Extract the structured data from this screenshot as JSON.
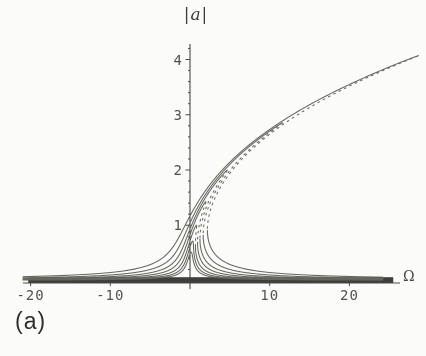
{
  "figure": {
    "title": "|a|",
    "x_axis_label": "Ω",
    "panel_label": "(a)",
    "background": "#fbfbf9"
  },
  "colors": {
    "curve": "#66665f",
    "unstable_dash": "#6b6b64",
    "axis": "#4a4a46",
    "zero_band": "#3e3e3b",
    "tick_text": "#53534e",
    "label_text": "#2e2e2b"
  },
  "chart_data": {
    "type": "line",
    "title": "|a|",
    "xlabel": "Ω",
    "ylabel": "|a|",
    "xlim": [
      -21,
      28.7
    ],
    "ylim": [
      0,
      4.3
    ],
    "x_ticks": [
      -20,
      -10,
      10,
      20
    ],
    "y_ticks": [
      1,
      2,
      3,
      4
    ],
    "y_minor_tick_step": 0.2,
    "grid": false,
    "legend": false,
    "model": {
      "equation": "a^2 * ((Ω - B(a))^2 + mu^2) = F^2, backbone B(a) = c * a^p",
      "backbone_coeff_c": 0.8,
      "backbone_power_p": 2.55,
      "damping_mu": 0.35,
      "forcing_F": [
        0.18,
        0.25,
        0.35,
        0.5,
        0.7,
        1.0,
        1.45
      ]
    },
    "series": [
      {
        "name": "F = 0.18",
        "forcing_F": 0.18,
        "peak_a": 0.51,
        "peak_omega": 0.14,
        "has_unstable_branch": false
      },
      {
        "name": "F = 0.25",
        "forcing_F": 0.25,
        "peak_a": 0.71,
        "peak_omega": 0.33,
        "has_unstable_branch": false
      },
      {
        "name": "F = 0.35",
        "forcing_F": 0.35,
        "peak_a": 1.0,
        "peak_omega": 0.8,
        "has_unstable_branch": true
      },
      {
        "name": "F = 0.50",
        "forcing_F": 0.5,
        "peak_a": 1.43,
        "peak_omega": 2.0,
        "has_unstable_branch": true
      },
      {
        "name": "F = 0.70",
        "forcing_F": 0.7,
        "peak_a": 2.0,
        "peak_omega": 4.7,
        "has_unstable_branch": true
      },
      {
        "name": "F = 1.00",
        "forcing_F": 1.0,
        "peak_a": 2.86,
        "peak_omega": 11.7,
        "has_unstable_branch": true
      },
      {
        "name": "F = 1.45",
        "forcing_F": 1.45,
        "peak_a": 4.14,
        "peak_omega": 29.9,
        "has_unstable_branch": true,
        "note": "clipped at right edge of plot window"
      }
    ],
    "zero_band": {
      "omega_range": [
        -20.3,
        25.5
      ],
      "a_range": [
        0.0,
        0.1
      ]
    }
  }
}
